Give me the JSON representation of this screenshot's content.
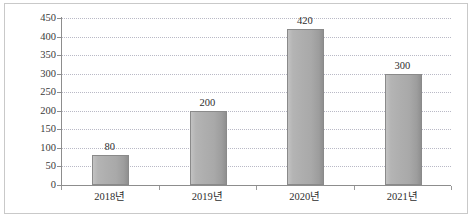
{
  "chart_data": {
    "type": "bar",
    "title": "",
    "subtitle": "",
    "xlabel": "",
    "ylabel": "",
    "categories": [
      "2018년",
      "2019년",
      "2020년",
      "2021년"
    ],
    "values": [
      80,
      200,
      420,
      300
    ],
    "series": [
      {
        "name": "",
        "values": [
          80,
          200,
          420,
          300
        ]
      }
    ],
    "data_labels": [
      "80",
      "200",
      "420",
      "300"
    ],
    "ylim": [
      0,
      450
    ],
    "ytick_step": 50,
    "ytick_labels": [
      "0",
      "50",
      "100",
      "150",
      "200",
      "250",
      "300",
      "350",
      "400",
      "450"
    ],
    "ytick_values": [
      0,
      50,
      100,
      150,
      200,
      250,
      300,
      350,
      400,
      450
    ],
    "grid": true,
    "grid_orientation": "horizontal",
    "grid_style": "dotted",
    "legend": false,
    "legend_position": "none",
    "colors": {
      "bar_fill_light": "#c2c2c2",
      "bar_fill_mid": "#aeaeae",
      "bar_fill_dark": "#8f8f8f",
      "bar_border": "#8a8a8a",
      "gridline": "#b9b9c6",
      "axis_line": "#8d8d8d",
      "text": "#2e2e2e",
      "frame_border": "#c9c9c9",
      "background": "#ffffff"
    }
  }
}
